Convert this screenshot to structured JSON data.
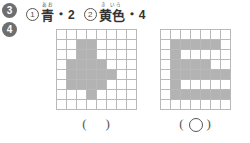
{
  "badges": [
    {
      "label": "3"
    },
    {
      "label": "4"
    }
  ],
  "legend": {
    "items": [
      {
        "marker": "1",
        "ruby": "あお",
        "word": "青",
        "separator": "・",
        "number": "2"
      },
      {
        "marker": "2",
        "ruby": "き いろ",
        "word": "黄色",
        "separator": "・",
        "number": "4"
      }
    ]
  },
  "grids": [
    {
      "name": "grid-left",
      "columns": 8,
      "rows": 8,
      "fill_color": "#b3b3b3",
      "line_color": "#b9b9b9",
      "cells": [
        [
          0,
          0,
          0,
          0,
          0,
          0,
          0,
          0
        ],
        [
          0,
          0,
          1,
          1,
          0,
          0,
          0,
          0
        ],
        [
          0,
          0,
          1,
          1,
          0,
          0,
          0,
          0
        ],
        [
          0,
          1,
          1,
          1,
          1,
          0,
          0,
          0
        ],
        [
          0,
          1,
          1,
          1,
          1,
          1,
          0,
          0
        ],
        [
          0,
          1,
          1,
          1,
          1,
          0,
          0,
          0
        ],
        [
          0,
          0,
          0,
          1,
          0,
          0,
          0,
          0
        ],
        [
          0,
          0,
          0,
          0,
          0,
          0,
          0,
          0
        ]
      ],
      "answer": {
        "open": "(",
        "close": ")",
        "mark": ""
      }
    },
    {
      "name": "grid-right",
      "columns": 7,
      "rows": 8,
      "fill_color": "#b3b3b3",
      "line_color": "#b9b9b9",
      "cells": [
        [
          0,
          0,
          0,
          0,
          0,
          0,
          0
        ],
        [
          0,
          1,
          1,
          1,
          1,
          1,
          0
        ],
        [
          0,
          1,
          0,
          0,
          0,
          0,
          0
        ],
        [
          0,
          1,
          1,
          1,
          1,
          0,
          0
        ],
        [
          0,
          1,
          1,
          1,
          1,
          1,
          1
        ],
        [
          0,
          1,
          0,
          0,
          0,
          0,
          0
        ],
        [
          0,
          1,
          1,
          1,
          1,
          1,
          1
        ],
        [
          0,
          0,
          0,
          0,
          0,
          0,
          0
        ]
      ],
      "answer": {
        "open": "(",
        "close": ")",
        "mark": "○"
      }
    }
  ]
}
